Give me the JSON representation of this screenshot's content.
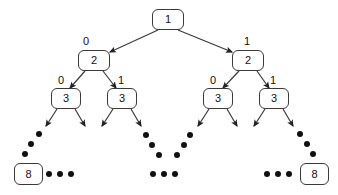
{
  "figure": {
    "colors": {
      "background": "#ffffff",
      "stroke": "#3a3a3a",
      "text": "#111111",
      "dot": "#111111"
    }
  },
  "nodes": [
    {
      "id": "root",
      "label": "1",
      "x": 152,
      "y": 9,
      "w": 32,
      "h": 21
    },
    {
      "id": "l2-left",
      "label": "2",
      "x": 78,
      "y": 50,
      "w": 32,
      "h": 21
    },
    {
      "id": "l2-right",
      "label": "2",
      "x": 232,
      "y": 50,
      "w": 32,
      "h": 21
    },
    {
      "id": "l3-a",
      "label": "3",
      "x": 51,
      "y": 88,
      "w": 30,
      "h": 21
    },
    {
      "id": "l3-b",
      "label": "3",
      "x": 107,
      "y": 88,
      "w": 30,
      "h": 21
    },
    {
      "id": "l3-c",
      "label": "3",
      "x": 203,
      "y": 88,
      "w": 30,
      "h": 21
    },
    {
      "id": "l3-d",
      "label": "3",
      "x": 259,
      "y": 88,
      "w": 30,
      "h": 21
    },
    {
      "id": "leaf-left",
      "label": "8",
      "x": 14,
      "y": 163,
      "w": 29,
      "h": 22
    },
    {
      "id": "leaf-right",
      "label": "8",
      "x": 300,
      "y": 163,
      "w": 29,
      "h": 22
    }
  ],
  "edge_labels": [
    {
      "id": "root-left",
      "label": "0",
      "x": 83,
      "y": 36
    },
    {
      "id": "root-right",
      "label": "1",
      "x": 244,
      "y": 36
    },
    {
      "id": "l2l-left",
      "label": "0",
      "x": 58,
      "y": 75
    },
    {
      "id": "l2l-right",
      "label": "1",
      "x": 118,
      "y": 75
    },
    {
      "id": "l2r-left",
      "label": "0",
      "x": 210,
      "y": 75
    },
    {
      "id": "l2r-right",
      "label": "1",
      "x": 270,
      "y": 75
    }
  ],
  "edges": [
    {
      "from": "root",
      "to": "l2-left",
      "x1": 158,
      "y1": 30,
      "x2": 110,
      "y2": 52,
      "label": "0"
    },
    {
      "from": "root",
      "to": "l2-right",
      "x1": 178,
      "y1": 30,
      "x2": 232,
      "y2": 52,
      "label": "1"
    },
    {
      "from": "l2-left",
      "to": "l3-a",
      "x1": 85,
      "y1": 71,
      "x2": 70,
      "y2": 88,
      "label": "0"
    },
    {
      "from": "l2-left",
      "to": "l3-b",
      "x1": 103,
      "y1": 71,
      "x2": 116,
      "y2": 88,
      "label": "1"
    },
    {
      "from": "l2-right",
      "to": "l3-c",
      "x1": 239,
      "y1": 71,
      "x2": 223,
      "y2": 88,
      "label": "0"
    },
    {
      "from": "l2-right",
      "to": "l3-d",
      "x1": 257,
      "y1": 71,
      "x2": 269,
      "y2": 88,
      "label": "1"
    },
    {
      "from": "l3-a",
      "to": "dots-a1",
      "x1": 57,
      "y1": 109,
      "x2": 46,
      "y2": 126,
      "label": ""
    },
    {
      "from": "l3-a",
      "to": "dots-a2",
      "x1": 75,
      "y1": 109,
      "x2": 85,
      "y2": 126,
      "label": ""
    },
    {
      "from": "l3-b",
      "to": "dots-b1",
      "x1": 113,
      "y1": 109,
      "x2": 102,
      "y2": 126,
      "label": ""
    },
    {
      "from": "l3-b",
      "to": "dots-b2",
      "x1": 131,
      "y1": 109,
      "x2": 141,
      "y2": 126,
      "label": ""
    },
    {
      "from": "l3-c",
      "to": "dots-c1",
      "x1": 209,
      "y1": 109,
      "x2": 198,
      "y2": 126,
      "label": ""
    },
    {
      "from": "l3-c",
      "to": "dots-c2",
      "x1": 227,
      "y1": 109,
      "x2": 237,
      "y2": 126,
      "label": ""
    },
    {
      "from": "l3-d",
      "to": "dots-d1",
      "x1": 265,
      "y1": 109,
      "x2": 254,
      "y2": 126,
      "label": ""
    },
    {
      "from": "l3-d",
      "to": "dots-d2",
      "x1": 283,
      "y1": 109,
      "x2": 293,
      "y2": 126,
      "label": ""
    }
  ],
  "ellipsis_dots": [
    {
      "group": "left-diagonal",
      "x": 39,
      "y": 134,
      "r": 3.4
    },
    {
      "group": "left-diagonal",
      "x": 31,
      "y": 144,
      "r": 3.4
    },
    {
      "group": "left-diagonal",
      "x": 25,
      "y": 154,
      "r": 3.4
    },
    {
      "group": "left-row",
      "x": 49,
      "y": 174,
      "r": 3.4
    },
    {
      "group": "left-row",
      "x": 60,
      "y": 174,
      "r": 3.4
    },
    {
      "group": "left-row",
      "x": 71,
      "y": 174,
      "r": 3.4
    },
    {
      "group": "inner-left-diagonal",
      "x": 146,
      "y": 135,
      "r": 3.4
    },
    {
      "group": "inner-left-diagonal",
      "x": 152,
      "y": 145,
      "r": 3.4
    },
    {
      "group": "inner-left-diagonal",
      "x": 159,
      "y": 155,
      "r": 3.4
    },
    {
      "group": "inner-right-diagonal",
      "x": 190,
      "y": 135,
      "r": 3.4
    },
    {
      "group": "inner-right-diagonal",
      "x": 184,
      "y": 145,
      "r": 3.4
    },
    {
      "group": "inner-right-diagonal",
      "x": 177,
      "y": 155,
      "r": 3.4
    },
    {
      "group": "center-row",
      "x": 153,
      "y": 174,
      "r": 3.4
    },
    {
      "group": "center-row",
      "x": 164,
      "y": 174,
      "r": 3.4
    },
    {
      "group": "center-row",
      "x": 175,
      "y": 174,
      "r": 3.4
    },
    {
      "group": "right-diagonal",
      "x": 300,
      "y": 134,
      "r": 3.4
    },
    {
      "group": "right-diagonal",
      "x": 307,
      "y": 144,
      "r": 3.4
    },
    {
      "group": "right-diagonal",
      "x": 313,
      "y": 154,
      "r": 3.4
    },
    {
      "group": "right-row",
      "x": 267,
      "y": 174,
      "r": 3.4
    },
    {
      "group": "right-row",
      "x": 278,
      "y": 174,
      "r": 3.4
    },
    {
      "group": "right-row",
      "x": 289,
      "y": 174,
      "r": 3.4
    }
  ]
}
